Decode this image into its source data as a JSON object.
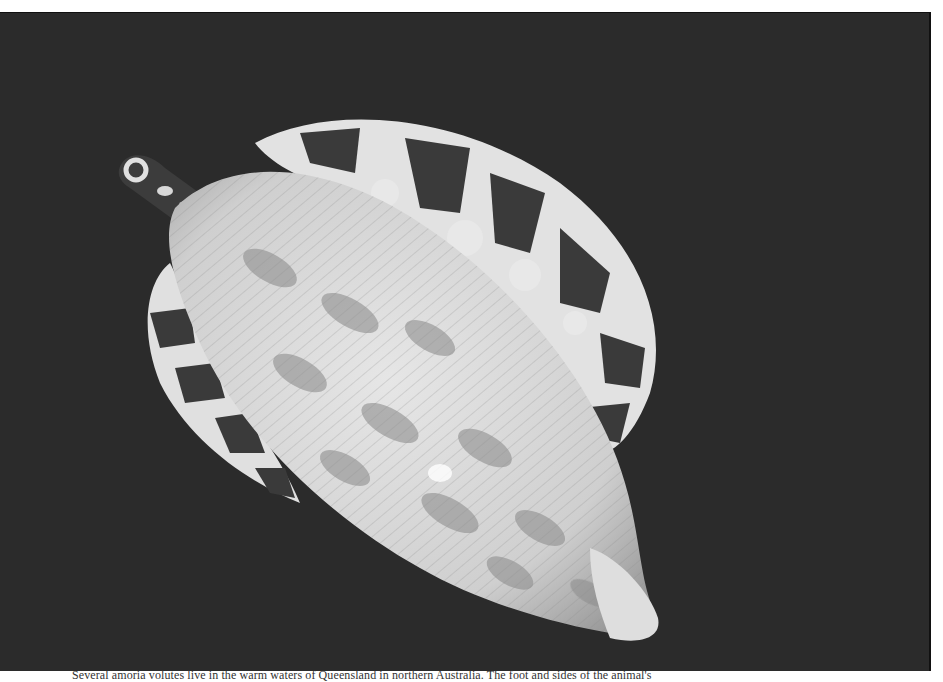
{
  "figure": {
    "background_color": "#2b2b2b",
    "shell_color": "#d8d8d8",
    "pattern_dark": "#3a3a3a",
    "pattern_light": "#e4e4e4"
  },
  "caption": {
    "text": "Several amoria volutes live in the warm waters of Queensland in northern Australia. The foot and sides of the animal's"
  }
}
